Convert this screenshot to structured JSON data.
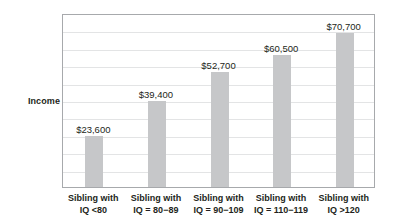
{
  "chart_data": {
    "type": "bar",
    "title": "",
    "subtitle": "",
    "xlabel": "",
    "ylabel": "Income",
    "categories": [
      "Sibling with IQ <80",
      "Sibling with IQ = 80−89",
      "Sibling with IQ = 90−109",
      "Sibling with IQ = 110−119",
      "Sibling with IQ >120"
    ],
    "category_lines": [
      [
        "Sibling with",
        "IQ <80"
      ],
      [
        "Sibling with",
        "IQ = 80−89"
      ],
      [
        "Sibling with",
        "IQ = 90−109"
      ],
      [
        "Sibling with",
        "IQ = 110−119"
      ],
      [
        "Sibling with",
        "IQ >120"
      ]
    ],
    "values": [
      23600,
      39400,
      52700,
      60500,
      70700
    ],
    "value_labels": [
      "$23,600",
      "$39,400",
      "$52,700",
      "$60,500",
      "$70,700"
    ],
    "ylim": [
      0,
      80000
    ],
    "grid": true,
    "gridline_count": 9,
    "legend": "none",
    "bar_color": "#c6c7c9",
    "axis_color": "#a7a9ac",
    "gridline_color": "#e3e4e5",
    "text_color": "#231f20",
    "background": "#ffffff"
  },
  "axis": {
    "y_title": "Income"
  }
}
